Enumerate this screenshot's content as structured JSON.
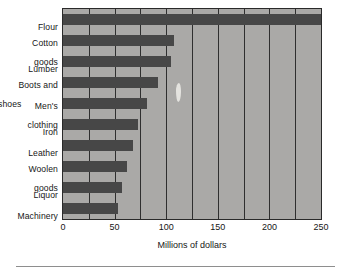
{
  "chart_data": {
    "type": "bar",
    "orientation": "horizontal",
    "title": "",
    "subtitle": "",
    "xlabel": "Millions of dollars",
    "ylabel": "",
    "categories": [
      "Flour",
      "Cotton goods",
      "Lumber",
      "Boots and shoes",
      "Men's clothing",
      "Iron",
      "Leather",
      "Woolen goods",
      "Liquor",
      "Machinery"
    ],
    "category_lines": [
      [
        "Flour"
      ],
      [
        "Cotton",
        "goods"
      ],
      [
        "Lumber"
      ],
      [
        "Boots and",
        "shoes"
      ],
      [
        "Men's",
        "clothing"
      ],
      [
        "Iron"
      ],
      [
        "Leather"
      ],
      [
        "Woolen",
        "goods"
      ],
      [
        "Liquor"
      ],
      [
        "Machinery"
      ]
    ],
    "values": [
      250,
      108,
      105,
      92,
      81,
      73,
      68,
      62,
      57,
      53
    ],
    "xlim": [
      0,
      250
    ],
    "xticks": [
      0,
      50,
      100,
      150,
      200,
      250
    ],
    "xtick_labels": [
      "0",
      "50",
      "100",
      "150",
      "200",
      "250"
    ],
    "minor_gridlines": [
      25,
      50,
      75,
      100,
      125,
      150,
      175,
      200,
      225
    ],
    "grid": true,
    "legend": "none",
    "colors": {
      "bar": "#474747",
      "plot_background": "#aaa9a7",
      "axis": "#2a2a2a",
      "gridline": "#2f2f2f",
      "text": "#161616",
      "page_background": "#ffffff",
      "rule": "#8e8e8e"
    }
  }
}
